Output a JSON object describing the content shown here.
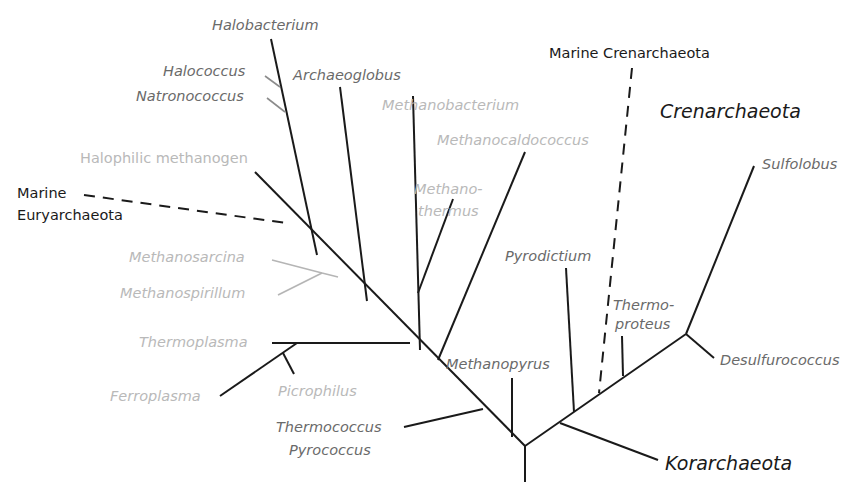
{
  "diagram": {
    "type": "phylogenetic-tree",
    "colors": {
      "branch": "#1a1a1a",
      "label_dark": "#6a6a6a",
      "label_light": "#b9b9b9",
      "label_black": "#1a1a1a",
      "gray_branch": "#b0b0b0"
    },
    "groups": {
      "crenarchaeota": "Crenarchaeota",
      "korarchaeota": "Korarchaeota",
      "marine_crenarchaeota": "Marine Crenarchaeota",
      "marine_euryarchaeota_1": "Marine",
      "marine_euryarchaeota_2": "Euryarchaeota"
    },
    "taxa": {
      "halobacterium": "Halobacterium",
      "halococcus": "Halococcus",
      "natronococcus": "Natronococcus",
      "archaeoglobus": "Archaeoglobus",
      "methanobacterium": "Methanobacterium",
      "methanocaldococcus": "Methanocaldococcus",
      "halophilic_methanogen": "Halophilic methanogen",
      "methanothermus_1": "Methano-",
      "methanothermus_2": "thermus",
      "methanosarcina": "Methanosarcina",
      "methanospirillum": "Methanospirillum",
      "thermoplasma": "Thermoplasma",
      "ferroplasma": "Ferroplasma",
      "picrophilus": "Picrophilus",
      "thermococcus": "Thermococcus",
      "pyrococcus": "Pyrococcus",
      "methanopyrus": "Methanopyrus",
      "pyrodictium": "Pyrodictium",
      "thermoproteus_1": "Thermo-",
      "thermoproteus_2": "proteus",
      "sulfolobus": "Sulfolobus",
      "desulfurococcus": "Desulfurococcus"
    }
  }
}
